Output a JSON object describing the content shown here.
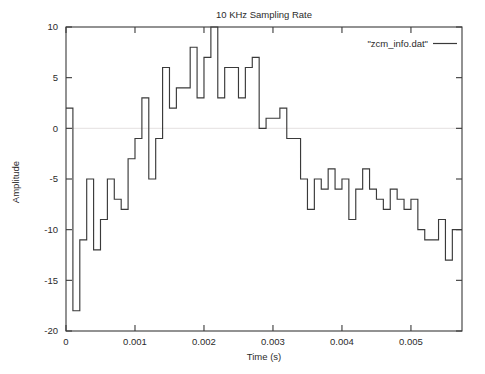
{
  "chart_data": {
    "type": "line",
    "title": "10 KHz Sampling Rate",
    "xlabel": "Time (s)",
    "ylabel": "Amplitude",
    "legend": [
      "\"zcm_info.dat\""
    ],
    "legend_position": "top-right",
    "grid": "y-zero-only",
    "line_style": "steps-post",
    "xlim": [
      0,
      0.00574
    ],
    "ylim": [
      -20,
      10
    ],
    "xticks": [
      0,
      0.001,
      0.002,
      0.003,
      0.004,
      0.005
    ],
    "xtick_labels": [
      "0",
      "0.001",
      "0.002",
      "0.003",
      "0.004",
      "0.005"
    ],
    "yticks": [
      10,
      5,
      0,
      -5,
      -10,
      -15,
      -20
    ],
    "ytick_labels": [
      "10",
      "5",
      "0",
      "-5",
      "-10",
      "-15",
      "-20"
    ],
    "sample_interval": 0.0001,
    "series": [
      {
        "name": "\"zcm_info.dat\"",
        "color": "#3a3a3a",
        "x": [
          0,
          0.0001,
          0.0002,
          0.0003,
          0.0004,
          0.0005,
          0.0006,
          0.0007,
          0.0008,
          0.0009,
          0.001,
          0.0011,
          0.0012,
          0.0013,
          0.0014,
          0.0015,
          0.0016,
          0.0017,
          0.0018,
          0.0019,
          0.002,
          0.0021,
          0.0022,
          0.0023,
          0.0024,
          0.0025,
          0.0026,
          0.0027,
          0.0028,
          0.0029,
          0.003,
          0.0031,
          0.0032,
          0.0033,
          0.0034,
          0.0035,
          0.0036,
          0.0037,
          0.0038,
          0.0039,
          0.004,
          0.0041,
          0.0042,
          0.0043,
          0.0044,
          0.0045,
          0.0046,
          0.0047,
          0.0048,
          0.0049,
          0.005,
          0.0051,
          0.0052,
          0.0053,
          0.0054,
          0.0055,
          0.0056,
          0.0057
        ],
        "values": [
          2,
          -18,
          -11,
          -5,
          -12,
          -9,
          -5,
          -7,
          -8,
          -3,
          -1,
          3,
          -5,
          -1,
          6,
          2,
          4,
          4,
          8,
          3,
          7,
          10,
          3,
          6,
          6,
          3,
          6,
          7,
          0,
          1,
          1,
          2,
          -1,
          -1,
          -5,
          -8,
          -5,
          -6,
          -4,
          -6,
          -5,
          -9,
          -6,
          -4,
          -6,
          -7,
          -8,
          -6,
          -7,
          -8,
          -7,
          -10,
          -11,
          -11,
          -9,
          -13,
          -10,
          -10
        ]
      }
    ]
  },
  "colors": {
    "background": "#ffffff",
    "axis": "#3a3a3a",
    "text": "#2b2b2b",
    "grid": "#e4e0e0",
    "series": "#3a3a3a"
  }
}
